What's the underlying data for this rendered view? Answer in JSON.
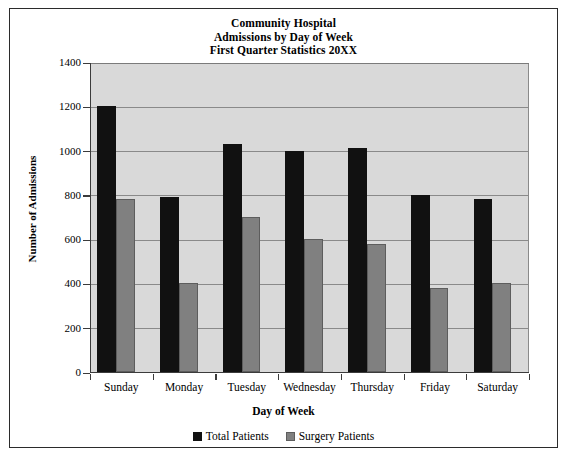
{
  "chart_data": {
    "type": "bar",
    "title": "Community Hospital\nAdmissions by Day of Week\nFirst Quarter Statistics 20XX",
    "title_lines": [
      "Community Hospital",
      "Admissions by Day of Week",
      "First Quarter Statistics 20XX"
    ],
    "xlabel": "Day of Week",
    "ylabel": "Number of Admissions",
    "categories": [
      "Sunday",
      "Monday",
      "Tuesday",
      "Wednesday",
      "Thursday",
      "Friday",
      "Saturday"
    ],
    "series": [
      {
        "name": "Total Patients",
        "color": "#111111",
        "values": [
          1200,
          790,
          1030,
          1000,
          1010,
          800,
          780
        ]
      },
      {
        "name": "Surgery Patients",
        "color": "#808080",
        "values": [
          780,
          400,
          700,
          600,
          580,
          380,
          400
        ]
      }
    ],
    "ylim": [
      0,
      1400
    ],
    "ytick_values": [
      0,
      200,
      400,
      600,
      800,
      1000,
      1200,
      1400
    ],
    "ytick_labels": [
      "0",
      "200",
      "400",
      "600",
      "800",
      "1000",
      "1200",
      "1400"
    ],
    "grid": true,
    "grid_axis": "y",
    "legend_position": "bottom",
    "plot_background": "#d9d9d9",
    "gridline_color": "#8a8a8a",
    "frame_border_color": "#2b2b2b"
  }
}
